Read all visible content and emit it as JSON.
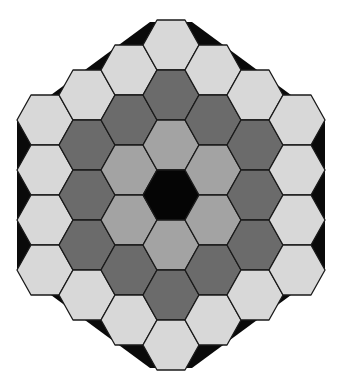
{
  "diagram": {
    "type": "hexagonal-tiling",
    "center": {
      "x": 171,
      "y": 195
    },
    "cell": {
      "half_width": 28,
      "half_height": 25,
      "col_step": 42,
      "row_step": 50
    },
    "rings": 3,
    "background_color": "#ffffff",
    "backing_color": "#0a0a0a",
    "outline_color": "#1a1a1a",
    "ring_colors": [
      {
        "ring": 0,
        "label": "center",
        "count": 1,
        "color": "#050505"
      },
      {
        "ring": 1,
        "label": "inner ring",
        "count": 6,
        "color": "#a3a3a3"
      },
      {
        "ring": 2,
        "label": "middle ring",
        "count": 12,
        "color": "#6b6b6b"
      },
      {
        "ring": 3,
        "label": "outer ring",
        "count": 18,
        "color": "#d8d8d8"
      }
    ],
    "backing_polygon": [
      [
        17,
        120
      ],
      [
        150,
        22
      ],
      [
        192,
        22
      ],
      [
        325,
        120
      ],
      [
        325,
        270
      ],
      [
        192,
        368
      ],
      [
        150,
        368
      ],
      [
        17,
        270
      ]
    ]
  }
}
